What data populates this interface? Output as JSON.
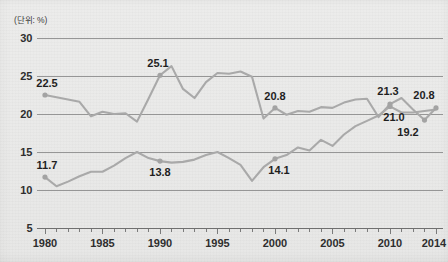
{
  "unit_note": "(단위: %)",
  "chart_data": {
    "type": "line",
    "title": "",
    "subtitle": "",
    "xlabel": "",
    "ylabel": "",
    "unit_note": "(단위: %)",
    "xlim": [
      1980,
      2014
    ],
    "ylim": [
      5,
      30
    ],
    "ytick_values": [
      30,
      25,
      20,
      15,
      10,
      5
    ],
    "ytick_labels": [
      "30",
      "25",
      "20",
      "15",
      "10",
      "5"
    ],
    "xtick_values": [
      1980,
      1985,
      1990,
      1995,
      2000,
      2005,
      2010,
      2014
    ],
    "xtick_labels": [
      "1980",
      "1985",
      "1990",
      "1995",
      "2000",
      "2005",
      "2010",
      "2014"
    ],
    "x_minor_tick_step": 1,
    "grid": "horizontal",
    "legend": "none",
    "line_color": "#a9a9a9",
    "marker_color": "#a3a3a3",
    "gridline_color": "#8d8d8d",
    "background_color": "#eaeae9",
    "x": [
      1980,
      1981,
      1982,
      1983,
      1984,
      1985,
      1986,
      1987,
      1988,
      1989,
      1990,
      1991,
      1992,
      1993,
      1994,
      1995,
      1996,
      1997,
      1998,
      1999,
      2000,
      2001,
      2002,
      2003,
      2004,
      2005,
      2006,
      2007,
      2008,
      2009,
      2010,
      2011,
      2012,
      2013,
      2014
    ],
    "series": [
      {
        "name": "upper-series",
        "values": [
          22.5,
          22.2,
          21.9,
          21.6,
          19.7,
          20.3,
          20.0,
          20.1,
          19.0,
          22.0,
          25.1,
          26.3,
          23.3,
          22.1,
          24.2,
          25.4,
          25.3,
          25.6,
          24.9,
          19.4,
          20.8,
          19.9,
          20.4,
          20.3,
          20.9,
          20.8,
          21.5,
          21.9,
          22.0,
          19.6,
          21.3,
          22.1,
          20.6,
          19.2,
          20.8
        ],
        "labeled_points": [
          {
            "x": 1980,
            "value": 22.5,
            "label": "22.5"
          },
          {
            "x": 1990,
            "value": 25.1,
            "label": "25.1"
          },
          {
            "x": 2000,
            "value": 20.8,
            "label": "20.8"
          },
          {
            "x": 2010,
            "value": 21.3,
            "label": "21.3"
          },
          {
            "x": 2013,
            "value": 19.2,
            "label": "19.2"
          },
          {
            "x": 2014,
            "value": 20.8,
            "label": "20.8"
          }
        ]
      },
      {
        "name": "lower-series",
        "values": [
          11.7,
          10.5,
          11.1,
          11.8,
          12.4,
          12.4,
          13.2,
          14.2,
          15.0,
          14.2,
          13.8,
          13.6,
          13.7,
          14.0,
          14.6,
          15.0,
          14.2,
          13.3,
          11.2,
          13.0,
          14.1,
          14.6,
          15.6,
          15.2,
          16.6,
          15.8,
          17.3,
          18.4,
          19.1,
          19.8,
          21.0,
          20.2,
          20.2,
          20.4,
          20.6
        ],
        "labeled_points": [
          {
            "x": 1980,
            "value": 11.7,
            "label": "11.7"
          },
          {
            "x": 1990,
            "value": 13.8,
            "label": "13.8"
          },
          {
            "x": 2000,
            "value": 14.1,
            "label": "14.1"
          },
          {
            "x": 2010,
            "value": 21.0,
            "label": "21.0"
          }
        ]
      }
    ],
    "annotations": [
      {
        "text": "22.5",
        "x": 1980,
        "y": 22.5,
        "anchor": "above-right"
      },
      {
        "text": "25.1",
        "x": 1990,
        "y": 25.1,
        "anchor": "above-left"
      },
      {
        "text": "20.8",
        "x": 2000,
        "y": 20.8,
        "anchor": "above"
      },
      {
        "text": "21.3",
        "x": 2010,
        "y": 21.3,
        "anchor": "above"
      },
      {
        "text": "20.8",
        "x": 2014,
        "y": 20.8,
        "anchor": "above-left"
      },
      {
        "text": "19.2",
        "x": 2013,
        "y": 19.2,
        "anchor": "below-right"
      },
      {
        "text": "11.7",
        "x": 1980,
        "y": 11.7,
        "anchor": "above-right"
      },
      {
        "text": "13.8",
        "x": 1990,
        "y": 13.8,
        "anchor": "below"
      },
      {
        "text": "14.1",
        "x": 2000,
        "y": 14.1,
        "anchor": "below-right"
      },
      {
        "text": "21.0",
        "x": 2010,
        "y": 21.0,
        "anchor": "below"
      }
    ]
  }
}
